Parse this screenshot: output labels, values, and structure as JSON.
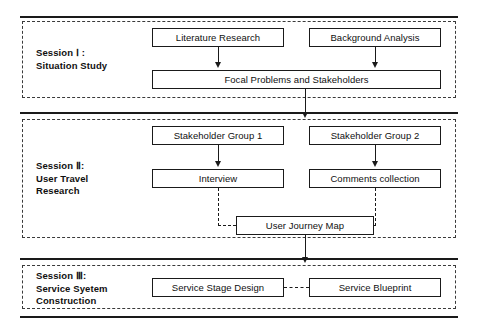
{
  "diagram": {
    "type": "flowchart",
    "title": "",
    "sessions": [
      {
        "id": "session-1",
        "label": "Session Ⅰ :\nSituation Study",
        "nodes": [
          {
            "id": "literature-research",
            "text": "Literature Research"
          },
          {
            "id": "background-analysis",
            "text": "Background Analysis"
          },
          {
            "id": "focal-problems-and-stakeholders",
            "text": "Focal Problems and Stakeholders"
          }
        ]
      },
      {
        "id": "session-2",
        "label": "Session Ⅱ:\nUser Travel\nResearch",
        "nodes": [
          {
            "id": "stakeholder-group-1",
            "text": "Stakeholder Group 1"
          },
          {
            "id": "stakeholder-group-2",
            "text": "Stakeholder Group 2"
          },
          {
            "id": "interview",
            "text": "Interview"
          },
          {
            "id": "comments-collection",
            "text": "Comments collection"
          },
          {
            "id": "user-journey-map",
            "text": "User Journey Map"
          }
        ]
      },
      {
        "id": "session-3",
        "label": "Session Ⅲ:\nService Syetem\nConstruction",
        "nodes": [
          {
            "id": "service-stage-design",
            "text": "Service Stage Design"
          },
          {
            "id": "service-blueprint",
            "text": "Service Blueprint"
          }
        ]
      }
    ],
    "connectors": [
      {
        "id": "literature-to-focal",
        "style": "solid-arrow"
      },
      {
        "id": "background-to-focal",
        "style": "solid-arrow"
      },
      {
        "id": "focal-to-session-2",
        "style": "solid-arrow"
      },
      {
        "id": "group1-to-interview",
        "style": "solid-arrow"
      },
      {
        "id": "group2-to-comments",
        "style": "solid-arrow"
      },
      {
        "id": "interview-to-journey-map",
        "style": "dashed"
      },
      {
        "id": "comments-to-journey-map",
        "style": "dashed"
      },
      {
        "id": "journey-map-to-session-3",
        "style": "solid-arrow"
      },
      {
        "id": "stage-design-to-blueprint",
        "style": "dashed"
      }
    ],
    "colors": {
      "stroke": "#1a1a1a",
      "background": "#ffffff",
      "text": "#101010"
    }
  }
}
